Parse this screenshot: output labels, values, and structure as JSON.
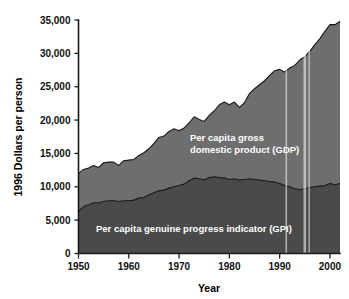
{
  "chart_data": {
    "type": "area",
    "title": "",
    "xlabel": "Year",
    "ylabel": "1996 Dollars per person",
    "xlim": [
      1950,
      2002
    ],
    "ylim": [
      0,
      35000
    ],
    "grid": false,
    "legend_position": "inline-annotation",
    "xticks": [
      1950,
      1960,
      1970,
      1980,
      1990,
      2000
    ],
    "xtick_labels": [
      "1950",
      "1960",
      "1970",
      "1980",
      "1990",
      "2000"
    ],
    "yticks": [
      0,
      5000,
      10000,
      15000,
      20000,
      25000,
      30000,
      35000
    ],
    "ytick_labels": [
      "0",
      "5,000",
      "10,000",
      "15,000",
      "20,000",
      "25,000",
      "30,000",
      "35,000"
    ],
    "x": [
      1950,
      1951,
      1952,
      1953,
      1954,
      1955,
      1956,
      1957,
      1958,
      1959,
      1960,
      1961,
      1962,
      1963,
      1964,
      1965,
      1966,
      1967,
      1968,
      1969,
      1970,
      1971,
      1972,
      1973,
      1974,
      1975,
      1976,
      1977,
      1978,
      1979,
      1980,
      1981,
      1982,
      1983,
      1984,
      1985,
      1986,
      1987,
      1988,
      1989,
      1990,
      1991,
      1992,
      1993,
      1994,
      1995,
      1996,
      1997,
      1998,
      1999,
      2000,
      2001,
      2002
    ],
    "series": [
      {
        "name": "Per capita gross domestic product (GDP)",
        "color": "#6e6e6e",
        "stack_order": "upper",
        "annotation": "Per capita gross\ndomestic product (GDP)",
        "values": [
          12000,
          12600,
          12800,
          13200,
          12900,
          13600,
          13700,
          13700,
          13200,
          13900,
          14000,
          14100,
          14700,
          15100,
          15700,
          16500,
          17400,
          17600,
          18300,
          18700,
          18400,
          18800,
          19600,
          20500,
          20100,
          19800,
          20700,
          21400,
          22300,
          22700,
          22300,
          22700,
          21900,
          22600,
          24000,
          24700,
          25300,
          25900,
          26700,
          27400,
          27600,
          27200,
          27800,
          28200,
          29000,
          29500,
          30300,
          31300,
          32200,
          33300,
          34300,
          34300,
          34800
        ]
      },
      {
        "name": "Per capita genuine progress indicator (GPI)",
        "color": "#4a4a4a",
        "stack_order": "lower",
        "annotation": "Per capita genuine progress indicator (GPI)",
        "values": [
          6300,
          7000,
          7300,
          7600,
          7600,
          7800,
          7900,
          7900,
          7800,
          7900,
          7900,
          8000,
          8300,
          8400,
          8800,
          9100,
          9400,
          9500,
          9800,
          10000,
          10200,
          10400,
          10900,
          11300,
          11200,
          11000,
          11400,
          11500,
          11400,
          11300,
          11100,
          11200,
          11000,
          11100,
          11200,
          11100,
          11000,
          10900,
          10800,
          10700,
          10500,
          10200,
          10000,
          9700,
          9600,
          9700,
          9900,
          10000,
          10100,
          10200,
          10500,
          10300,
          10500
        ]
      }
    ]
  },
  "axes": {
    "y_axis_title": "1996 Dollars per person",
    "x_axis_title": "Year"
  },
  "annotations": {
    "gdp_line_1": "Per capita gross",
    "gdp_line_2": "domestic product (GDP)",
    "gpi_line_1": "Per capita genuine progress indicator (GPI)"
  },
  "colors": {
    "gdp_fill": "#6e6e6e",
    "gpi_fill": "#4a4a4a",
    "outline": "#16181a",
    "axis": "#1a1a1a",
    "background": "#ffffff",
    "annotation_text": "#ffffff",
    "tick_text": "#111111"
  }
}
